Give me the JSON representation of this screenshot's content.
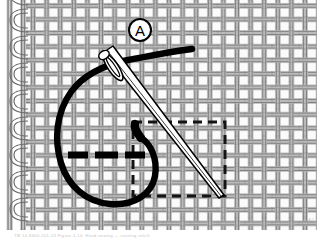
{
  "figure": {
    "width": 317,
    "height": 243,
    "background_color": "#ffffff",
    "ink_color": "#000000",
    "weave_color": "#8c8c8c",
    "weave_fill": "#f4f4f4"
  },
  "callout": {
    "label": "A",
    "shape": "circle",
    "cx": 140,
    "cy": 30,
    "r": 11,
    "stroke_color": "#000000",
    "font_size": 15
  },
  "fabric": {
    "type": "plain-woven-canvas",
    "cell_size": 13.6,
    "thread_width": 5.2,
    "selvage_side": "left",
    "selvage_loops": 9,
    "selvage_x": 26,
    "warp_count": 20,
    "weft_count": 16
  },
  "needle": {
    "name": "sewing-needle",
    "tip_x": 223,
    "tip_y": 196,
    "eye_x": 108,
    "eye_y": 57,
    "eye_length": 28,
    "eye_width": 9,
    "body_width": 5,
    "fill": "#ffffff",
    "stroke": "#000000"
  },
  "thread": {
    "name": "thread-loop",
    "stroke": "#000000",
    "stroke_width": 6,
    "tail_end_x": 192,
    "tail_end_y": 49,
    "loop_description": "thread passes through needle eye, loops counter-clockwise and re-enters fabric"
  },
  "stitches": {
    "running_stitch_y": 155,
    "dash_segments": [
      {
        "x1": 68,
        "x2": 88
      },
      {
        "x1": 95,
        "x2": 118
      },
      {
        "x1": 125,
        "x2": 145
      }
    ],
    "stitch_color": "#000000",
    "stitch_width": 7
  },
  "guide_rect": {
    "name": "dashed-stitch-path",
    "x": 133,
    "y": 122,
    "width": 92,
    "height": 74,
    "stroke": "#111111",
    "stroke_width": 3,
    "dash_pattern": "9 6",
    "style": "dashed"
  },
  "caption": {
    "text": "TM 10-8400-201-23   Figure 4-14.  Hand sewing — running stitch",
    "visible": "faint",
    "corner_mark": "A-1"
  }
}
